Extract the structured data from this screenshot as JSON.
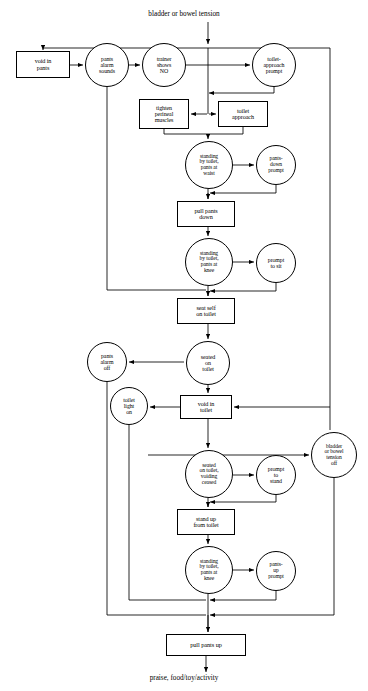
{
  "diagram": {
    "stroke_color": "#000000",
    "background_color": "#ffffff",
    "width": 368,
    "height": 691,
    "entry_label": "bladder or bowel tension",
    "exit_label": "praise, food/toy/activity",
    "nodes": [
      {
        "id": "void_pants",
        "label": "void in\npants",
        "shape": "box",
        "x": 16,
        "y": 51,
        "w": 54,
        "h": 27,
        "font": 6.2
      },
      {
        "id": "pants_alarm",
        "label": "pants\nalarm\nsounds",
        "shape": "circle",
        "x": 85,
        "y": 43,
        "w": 44,
        "h": 44,
        "font": 5.9
      },
      {
        "id": "trainer_no",
        "label": "trainer\nshows\nNO",
        "shape": "circle",
        "x": 142,
        "y": 43,
        "w": 44,
        "h": 44,
        "font": 5.9
      },
      {
        "id": "toilet_prompt",
        "label": "toilet-\napproach\nprompt",
        "shape": "circle",
        "x": 252,
        "y": 43,
        "w": 44,
        "h": 44,
        "font": 5.9
      },
      {
        "id": "tighten",
        "label": "tighten\nperineal\nmuscles",
        "shape": "box",
        "x": 139,
        "y": 99,
        "w": 50,
        "h": 30,
        "font": 6.0
      },
      {
        "id": "toilet_approach",
        "label": "toilet\napproach",
        "shape": "box",
        "x": 218,
        "y": 101,
        "w": 50,
        "h": 26,
        "font": 6.2
      },
      {
        "id": "stand_waist",
        "label": "standing\nby toilet,\npants at\nwaist",
        "shape": "circle",
        "x": 185,
        "y": 141,
        "w": 48,
        "h": 48,
        "font": 5.6
      },
      {
        "id": "pants_down_prompt",
        "label": "pants-\ndown\nprompt",
        "shape": "circle",
        "x": 256,
        "y": 145,
        "w": 40,
        "h": 40,
        "font": 5.6
      },
      {
        "id": "pull_pants_down",
        "label": "pull pants\ndown",
        "shape": "box",
        "x": 177,
        "y": 201,
        "w": 58,
        "h": 26,
        "font": 6.2
      },
      {
        "id": "stand_knee1",
        "label": "standing\nby toilet,\npants at\nknee",
        "shape": "circle",
        "x": 185,
        "y": 238,
        "w": 48,
        "h": 48,
        "font": 5.6
      },
      {
        "id": "prompt_to_sit",
        "label": "prompt\nto sit",
        "shape": "circle",
        "x": 256,
        "y": 243,
        "w": 40,
        "h": 40,
        "font": 5.9
      },
      {
        "id": "seat_self",
        "label": "seat self\non toilet",
        "shape": "box",
        "x": 177,
        "y": 298,
        "w": 58,
        "h": 26,
        "font": 6.2
      },
      {
        "id": "pants_alarm_off",
        "label": "pants\nalarm\noff",
        "shape": "circle",
        "x": 87,
        "y": 342,
        "w": 40,
        "h": 40,
        "font": 5.9
      },
      {
        "id": "seated_toilet",
        "label": "seated\non\ntoilet",
        "shape": "circle",
        "x": 186,
        "y": 341,
        "w": 44,
        "h": 44,
        "font": 6.0
      },
      {
        "id": "toilet_light_on",
        "label": "toilet\nlight\non",
        "shape": "circle",
        "x": 110,
        "y": 387,
        "w": 38,
        "h": 38,
        "font": 5.9
      },
      {
        "id": "void_toilet",
        "label": "void in\ntoilet",
        "shape": "box",
        "x": 180,
        "y": 395,
        "w": 52,
        "h": 24,
        "font": 6.2
      },
      {
        "id": "tension_off",
        "label": "bladder\nor bowel\ntension\noff",
        "shape": "circle",
        "x": 311,
        "y": 432,
        "w": 46,
        "h": 46,
        "font": 5.6
      },
      {
        "id": "voiding_ceased",
        "label": "seated\non toilet,\nvoiding\nceased",
        "shape": "circle",
        "x": 185,
        "y": 450,
        "w": 48,
        "h": 48,
        "font": 5.6
      },
      {
        "id": "prompt_to_stand",
        "label": "prompt\nto\nstand",
        "shape": "circle",
        "x": 256,
        "y": 455,
        "w": 40,
        "h": 40,
        "font": 5.9
      },
      {
        "id": "stand_up",
        "label": "stand up\nfrom toilet",
        "shape": "box",
        "x": 177,
        "y": 509,
        "w": 58,
        "h": 26,
        "font": 6.2
      },
      {
        "id": "stand_knee2",
        "label": "standing\nby toilet,\npants at\nknee",
        "shape": "circle",
        "x": 185,
        "y": 546,
        "w": 48,
        "h": 48,
        "font": 5.6
      },
      {
        "id": "pants_up_prompt",
        "label": "pants-\nup\nprompt",
        "shape": "circle",
        "x": 256,
        "y": 551,
        "w": 40,
        "h": 40,
        "font": 5.6
      },
      {
        "id": "pull_pants_up",
        "label": "pull pants up",
        "shape": "box",
        "x": 166,
        "y": 634,
        "w": 80,
        "h": 22,
        "font": 6.4
      }
    ]
  }
}
